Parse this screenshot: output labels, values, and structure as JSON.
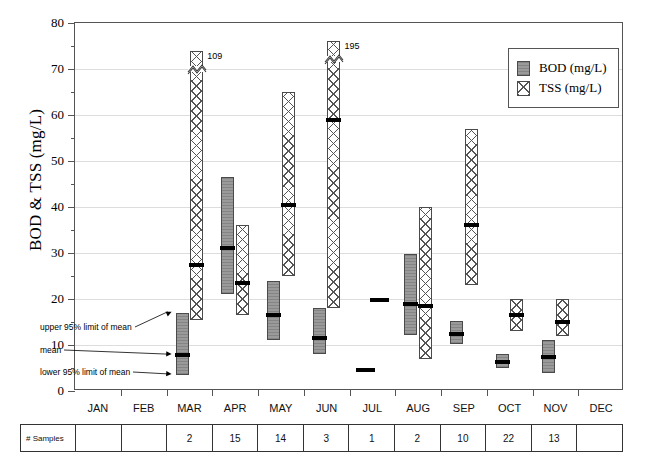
{
  "chart_data": {
    "type": "bar",
    "title": "",
    "xlabel": "",
    "ylabel": "BOD & TSS (mg/L)",
    "ylim": [
      0,
      80
    ],
    "ytick_step": 10,
    "yticks": [
      0,
      10,
      20,
      30,
      40,
      50,
      60,
      70,
      80
    ],
    "ytick_labels": [
      "0",
      "10",
      "20",
      "30",
      "40",
      "50",
      "60",
      "70",
      "80"
    ],
    "minor_ytick_step": 5,
    "grid": "horizontal",
    "legend_position": "top-right",
    "categories": [
      "JAN",
      "FEB",
      "MAR",
      "APR",
      "MAY",
      "JUN",
      "JUL",
      "AUG",
      "SEP",
      "OCT",
      "NOV",
      "DEC"
    ],
    "series": [
      {
        "name": "BOD (mg/L)",
        "style": "solid-gray",
        "means": [
          null,
          null,
          7.8,
          31.0,
          16.5,
          11.5,
          4.5,
          19.0,
          12.5,
          6.3,
          7.5,
          null
        ],
        "lower95": [
          null,
          null,
          3.5,
          21.0,
          11.0,
          8.0,
          null,
          12.2,
          10.2,
          5.0,
          4.0,
          null
        ],
        "upper95": [
          null,
          null,
          17.0,
          46.5,
          24.0,
          18.0,
          null,
          29.8,
          15.2,
          8.0,
          11.0,
          null
        ]
      },
      {
        "name": "TSS (mg/L)",
        "style": "cross-hatch",
        "means": [
          null,
          null,
          27.5,
          23.5,
          40.5,
          59.0,
          19.8,
          18.5,
          36.0,
          16.5,
          15.0,
          null
        ],
        "lower95": [
          null,
          null,
          15.5,
          16.5,
          25.0,
          18.0,
          null,
          7.0,
          23.0,
          13.0,
          12.0,
          null
        ],
        "upper95": [
          null,
          null,
          109.0,
          36.0,
          65.0,
          195.0,
          null,
          40.0,
          57.0,
          20.0,
          20.0,
          null
        ],
        "axis_break_value": 74,
        "broken_bars": [
          {
            "category": "MAR",
            "label": "109",
            "drawn_top": 74.0
          },
          {
            "category": "JUN",
            "label": "195",
            "drawn_top": 76.0
          }
        ]
      }
    ],
    "annotations": [
      {
        "text": "upper 95% limit of mean",
        "target_category": "MAR",
        "target_series": "BOD (mg/L)",
        "target_value": 17.0
      },
      {
        "text": "mean",
        "target_category": "MAR",
        "target_series": "BOD (mg/L)",
        "target_value": 7.8
      },
      {
        "text": "lower 95% limit of mean",
        "target_category": "MAR",
        "target_series": "BOD (mg/L)",
        "target_value": 3.5
      }
    ],
    "sample_table": {
      "row_header": "# Samples",
      "columns": [
        "JAN",
        "FEB",
        "MAR",
        "APR",
        "MAY",
        "JUN",
        "JUL",
        "AUG",
        "SEP",
        "OCT",
        "NOV",
        "DEC"
      ],
      "values": [
        "",
        "",
        "2",
        "15",
        "14",
        "3",
        "1",
        "2",
        "10",
        "22",
        "13",
        ""
      ]
    },
    "colors": {
      "bod_fill": "#9a9a9a",
      "tss_fill": "#ffffff",
      "hatch": "#555555",
      "mean_marker": "#000000",
      "grid": "#dddddd",
      "frame": "#555555"
    }
  },
  "legend": {
    "items": [
      {
        "label": "BOD (mg/L)",
        "swatch": "bod"
      },
      {
        "label": "TSS (mg/L)",
        "swatch": "tss"
      }
    ]
  },
  "axis": {
    "y_title": "BOD & TSS (mg/L)"
  }
}
